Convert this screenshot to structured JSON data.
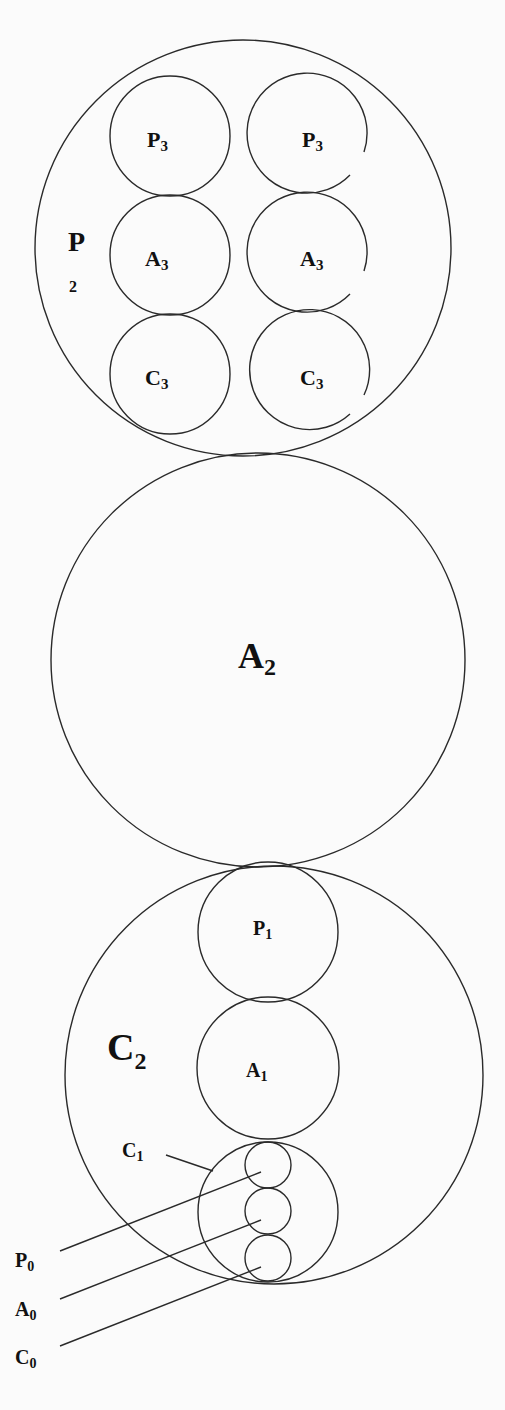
{
  "diagram": {
    "colors": {
      "stroke": "#2a2a2a",
      "text": "#111111",
      "background": "#fbfbfb"
    },
    "labels": {
      "p3_left": {
        "base": "P",
        "sub": "3"
      },
      "p3_right": {
        "base": "P",
        "sub": "3"
      },
      "a3_left": {
        "base": "A",
        "sub": "3"
      },
      "a3_right": {
        "base": "A",
        "sub": "3"
      },
      "c3_left": {
        "base": "C",
        "sub": "3"
      },
      "c3_right": {
        "base": "C",
        "sub": "3"
      },
      "p2": {
        "base": "P",
        "sub": "2"
      },
      "a2": {
        "base": "A",
        "sub": "2"
      },
      "c2": {
        "base": "C",
        "sub": "2"
      },
      "p1": {
        "base": "P",
        "sub": "1"
      },
      "a1": {
        "base": "A",
        "sub": "1"
      },
      "c1": {
        "base": "C",
        "sub": "1"
      },
      "p0": {
        "base": "P",
        "sub": "0"
      },
      "a0": {
        "base": "A",
        "sub": "0"
      },
      "c0": {
        "base": "C",
        "sub": "0"
      }
    }
  }
}
